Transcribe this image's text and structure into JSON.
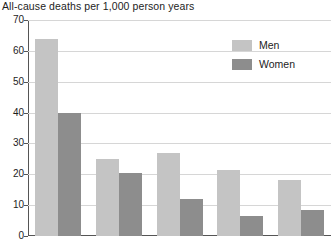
{
  "chart_data": {
    "type": "bar",
    "title": "All-cause deaths per 1,000 person years",
    "xlabel": "",
    "ylabel": "",
    "ylim": [
      0,
      70
    ],
    "ytick_step": 10,
    "yticks": [
      0,
      10,
      20,
      30,
      40,
      50,
      60,
      70
    ],
    "ytick_labels": [
      "0",
      "10",
      "20",
      "30",
      "40",
      "50",
      "60",
      "70"
    ],
    "grid": true,
    "grid_axis": "y",
    "legend_position": "top-right",
    "categories": [
      "1",
      "2",
      "3",
      "4",
      "5"
    ],
    "series": [
      {
        "name": "Men",
        "color": "#c4c4c4",
        "values": [
          64,
          25,
          27,
          21.5,
          18
        ]
      },
      {
        "name": "Women",
        "color": "#8d8d8d",
        "values": [
          40,
          20.5,
          12,
          6.5,
          8.5
        ]
      }
    ]
  },
  "legend": {
    "items": [
      {
        "label": "Men"
      },
      {
        "label": "Women"
      }
    ]
  },
  "colors": {
    "men": "#c4c4c4",
    "women": "#8d8d8d",
    "axis": "#555555",
    "grid": "#d6d6d6",
    "text": "#1d1d1d",
    "background": "#ffffff"
  }
}
